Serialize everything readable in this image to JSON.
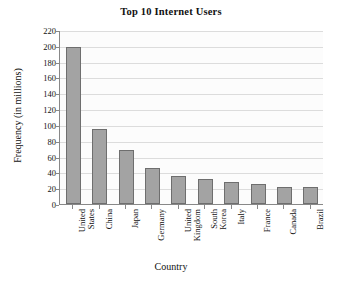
{
  "chart_data": {
    "type": "bar",
    "title": "Top 10 Internet Users",
    "xlabel": "Country",
    "ylabel": "Frequency (in millions)",
    "categories": [
      "United States",
      "China",
      "Japan",
      "Germany",
      "United Kingdom",
      "South Korea",
      "Italy",
      "France",
      "Canada",
      "Brazil"
    ],
    "category_lines": [
      [
        "United",
        "States"
      ],
      [
        "China"
      ],
      [
        "Japan"
      ],
      [
        "Germany"
      ],
      [
        "United",
        "Kingdom"
      ],
      [
        "South",
        "Korea"
      ],
      [
        "Italy"
      ],
      [
        "France"
      ],
      [
        "Canada"
      ],
      [
        "Brazil"
      ]
    ],
    "values": [
      198,
      95,
      68,
      46,
      35,
      31,
      28,
      25,
      22,
      21
    ],
    "ylim": [
      0,
      220
    ],
    "ytick_step": 20,
    "yticks": [
      0,
      20,
      40,
      60,
      80,
      100,
      120,
      140,
      160,
      180,
      200,
      220
    ],
    "ytick_labels": [
      "0",
      "20",
      "40",
      "60",
      "80",
      "100",
      "120",
      "140",
      "160",
      "180",
      "200",
      "220"
    ],
    "grid": true,
    "legend": false,
    "bar_color": "#a3a3a3",
    "bar_edge_color": "#6e6e6e",
    "grid_color": "#dcdcdc",
    "axis_color": "#888888",
    "plot_background": "#fcfcfc",
    "page_background": "#ffffff"
  }
}
